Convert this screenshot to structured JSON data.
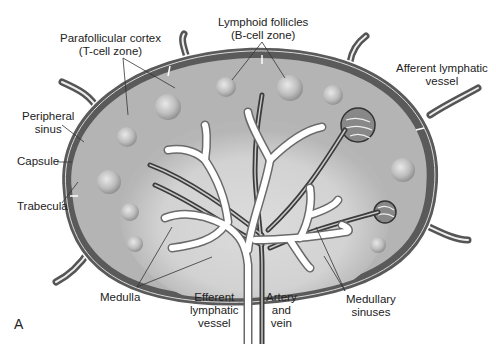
{
  "figure": {
    "panel_letter": "A",
    "colors": {
      "background": "#ffffff",
      "capsule_dark": "#5a5a5a",
      "cortex": "#b4b4b4",
      "medulla_light": "#d6d6d6",
      "follicle": "#c8c8c8",
      "sinus_white": "#ffffff",
      "vessel_dark": "#3c3c3c",
      "label_text": "#222222"
    }
  },
  "labels": {
    "parafollicular_cortex": [
      "Parafollicular cortex",
      "(T-cell zone)"
    ],
    "lymphoid_follicles": [
      "Lymphoid follicles",
      "(B-cell zone)"
    ],
    "afferent_lymphatic_vessel": [
      "Afferent lymphatic",
      "vessel"
    ],
    "peripheral_sinus": [
      "Peripheral",
      "sinus"
    ],
    "capsule": [
      "Capsule"
    ],
    "trabecula": [
      "Trabecula"
    ],
    "medulla": [
      "Medulla"
    ],
    "efferent_lymphatic_vessel": [
      "Efferent",
      "lymphatic",
      "vessel"
    ],
    "artery_and_vein": [
      "Artery",
      "and",
      "vein"
    ],
    "medullary_sinuses": [
      "Medullary",
      "sinuses"
    ]
  }
}
